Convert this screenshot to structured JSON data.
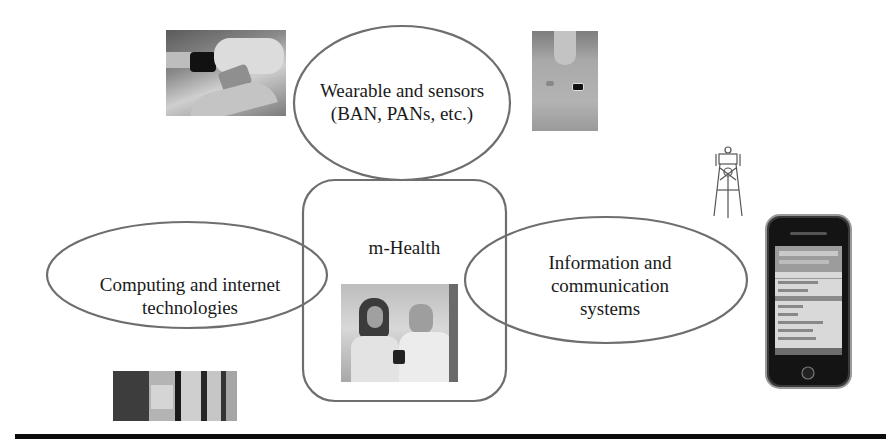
{
  "diagram": {
    "title": "m-Health",
    "center": {
      "label": "m-Health",
      "image": "doctors-with-mobile-device-photo"
    },
    "nodes": [
      {
        "id": "wearable",
        "label_line1": "Wearable and sensors",
        "label_line2": "(BAN, PANs, etc.)",
        "position": "top",
        "image": "wrist-wearable-device-photo",
        "image2": "chest-sensor-photo"
      },
      {
        "id": "computing",
        "label_line1": "Computing and internet",
        "label_line2": "technologies",
        "position": "left",
        "image": "server-rack-photo"
      },
      {
        "id": "ict",
        "label_line1": "Information and",
        "label_line2": "communication",
        "label_line3": "systems",
        "position": "right",
        "image": "smartphone-photo",
        "image2": "cell-tower-icon"
      }
    ],
    "colors": {
      "outline": "#6e6e6e",
      "text": "#1a1a1a",
      "rule": "#0b0b0b"
    }
  }
}
